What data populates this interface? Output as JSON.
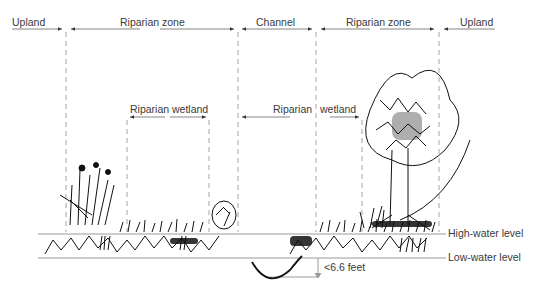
{
  "top_labels": {
    "upland_left": "Upland",
    "riparian_zone_left": "Riparian zone",
    "channel": "Channel",
    "riparian_zone_right": "Riparian zone",
    "upland_right": "Upland"
  },
  "wetland_labels": {
    "left": "Riparian wetland",
    "right_part1": "Riparian",
    "right_part2": "wetland"
  },
  "water_levels": {
    "high": "High-water level",
    "low": "Low-water level"
  },
  "depth_label": "<6.6 feet",
  "colors": {
    "line": "#9a9a9a",
    "ink": "#111111",
    "text": "#3a3a3a"
  }
}
